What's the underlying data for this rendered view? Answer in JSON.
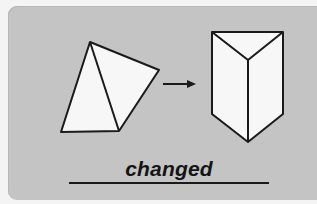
{
  "card": {
    "background_color": "#c4c4c4",
    "shape_fill": "#f7f7f7",
    "stroke_color": "#1a1a1a"
  },
  "figure": {
    "from_shape": "triangular-pyramid-net",
    "arrow": "right-arrow",
    "to_shape": "triangular-prism"
  },
  "answer": {
    "word": "changed"
  }
}
